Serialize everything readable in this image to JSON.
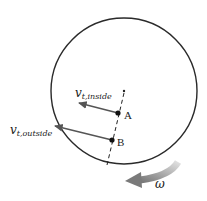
{
  "diagram": {
    "type": "rotating disk with tangential velocities",
    "disk": {
      "cx": 124,
      "cy": 91,
      "r": 73,
      "stroke": "#2a2a2a"
    },
    "radial_line": {
      "style": "dashed",
      "from": [
        124,
        90
      ],
      "to": [
        107,
        165
      ]
    },
    "points": [
      {
        "label": "A",
        "x": 118,
        "y": 113
      },
      {
        "label": "B",
        "x": 112,
        "y": 140
      }
    ],
    "vectors": [
      {
        "name": "v_t_inside",
        "label_main": "v",
        "label_sub": "t,inside",
        "from": [
          118,
          113
        ],
        "to": [
          78,
          103
        ]
      },
      {
        "name": "v_t_outside",
        "label_main": "v",
        "label_sub": "t,outside",
        "from": [
          112,
          140
        ],
        "to": [
          54,
          126
        ]
      }
    ],
    "rotation": {
      "symbol": "ω",
      "arrow_color": "#8a8a8a",
      "direction": "counterclockwise"
    }
  }
}
